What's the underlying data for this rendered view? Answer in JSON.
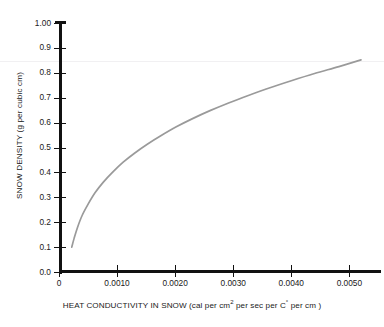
{
  "chart_data": {
    "type": "line",
    "title": "",
    "xlabel": "HEAT CONDUCTIVITY IN SNOW (cal per cm2 per sec  per C° per cm )",
    "ylabel": "SNOW DENSITY (g per cubic cm)",
    "xlim": [
      0,
      0.0052
    ],
    "ylim": [
      0,
      1.0
    ],
    "grid": false,
    "legend": null,
    "x_tick_labels": [
      "0",
      "0.0010",
      "0.0020",
      "0.0030",
      "0.0040",
      "0.0050"
    ],
    "x_tick_values": [
      0,
      0.001,
      0.002,
      0.003,
      0.004,
      0.005
    ],
    "y_tick_labels": [
      "0.0",
      "0.1",
      "0.2",
      "0.3",
      "0.4",
      "0.5",
      "0.6",
      "0.7",
      "0.8",
      "0.9",
      "1.00"
    ],
    "y_tick_values": [
      0.0,
      0.1,
      0.2,
      0.3,
      0.4,
      0.5,
      0.6,
      0.7,
      0.8,
      0.9,
      1.0
    ],
    "series": [
      {
        "name": "snow density vs heat conductivity",
        "color": "#9a9a9a",
        "x": [
          0.00022,
          0.00026,
          0.00032,
          0.0004,
          0.0005,
          0.00062,
          0.00076,
          0.00092,
          0.0011,
          0.0013,
          0.00152,
          0.00176,
          0.00202,
          0.0023,
          0.0026,
          0.00292,
          0.00326,
          0.00362,
          0.004,
          0.0044,
          0.00482,
          0.0052
        ],
        "y": [
          0.1,
          0.135,
          0.18,
          0.228,
          0.272,
          0.318,
          0.36,
          0.4,
          0.44,
          0.477,
          0.513,
          0.548,
          0.583,
          0.616,
          0.648,
          0.679,
          0.709,
          0.739,
          0.768,
          0.797,
          0.825,
          0.852
        ]
      }
    ]
  },
  "axis_titles": {
    "y": "SNOW DENSITY (g per cubic cm)",
    "x_prefix": "HEAT CONDUCTIVITY IN SNOW (cal per cm",
    "x_sup1": "2",
    "x_mid": " per sec  per C",
    "x_sup2": "°",
    "x_suffix": " per cm )"
  }
}
